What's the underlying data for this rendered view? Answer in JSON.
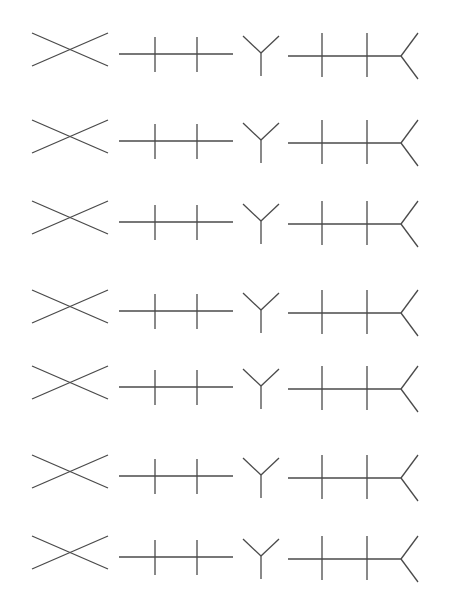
{
  "figure": {
    "width": 450,
    "height": 608,
    "background": "#ffffff",
    "stroke_color": "#4a4a4a",
    "stroke_width": 1.3
  },
  "row_template": {
    "x_shape": {
      "lines": [
        [
          32,
          -17,
          108,
          16
        ],
        [
          32,
          16,
          108,
          -17
        ]
      ]
    },
    "ticked_line": {
      "lines": [
        [
          119,
          4,
          233,
          4
        ],
        [
          155,
          -13,
          155,
          22
        ],
        [
          197,
          -13,
          197,
          22
        ]
      ]
    },
    "y_shape": {
      "lines": [
        [
          243,
          -14,
          261,
          3
        ],
        [
          279,
          -14,
          261,
          3
        ],
        [
          261,
          3,
          261,
          26
        ]
      ]
    },
    "forked_line": {
      "lines": [
        [
          288,
          6,
          401,
          6
        ],
        [
          322,
          -17,
          322,
          27
        ],
        [
          367,
          -17,
          367,
          27
        ],
        [
          401,
          6,
          418,
          -17
        ],
        [
          401,
          6,
          418,
          29
        ]
      ]
    }
  },
  "rows": [
    {
      "index": 1,
      "y": 50
    },
    {
      "index": 2,
      "y": 137
    },
    {
      "index": 3,
      "y": 218
    },
    {
      "index": 4,
      "y": 307
    },
    {
      "index": 5,
      "y": 383
    },
    {
      "index": 6,
      "y": 472
    },
    {
      "index": 7,
      "y": 553
    }
  ]
}
